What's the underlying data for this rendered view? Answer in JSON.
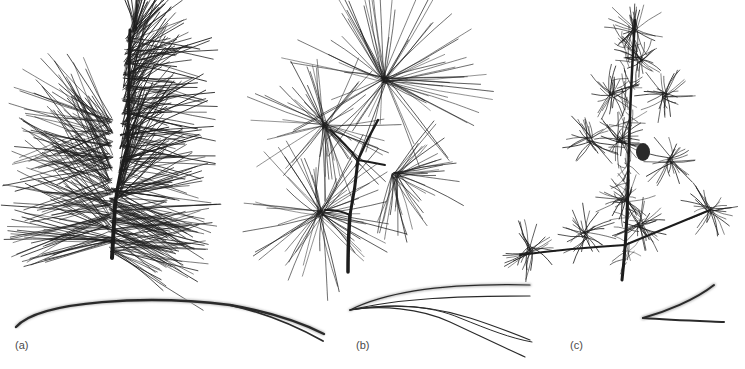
{
  "figure": {
    "panels": [
      {
        "id": "a",
        "label": "(a)",
        "description": "Pine branch with long needles in bundles of two",
        "needle_count_per_fascicle": 2,
        "ink_color": "#1a1a1a"
      },
      {
        "id": "b",
        "label": "(b)",
        "description": "Pine branch with long soft needles in bundles of five",
        "needle_count_per_fascicle": 5,
        "ink_color": "#1a1a1a"
      },
      {
        "id": "c",
        "label": "(c)",
        "description": "Pine branch with short needles in bundles of two",
        "needle_count_per_fascicle": 2,
        "ink_color": "#1a1a1a"
      }
    ],
    "background": "#ffffff"
  }
}
